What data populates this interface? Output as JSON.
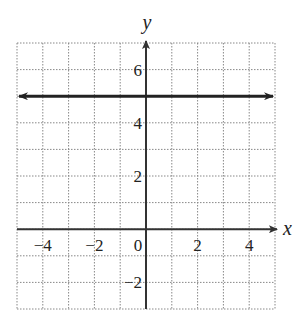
{
  "chart_data": {
    "type": "line",
    "title": "",
    "xlabel": "x",
    "ylabel": "y",
    "xlim": [
      -5,
      5
    ],
    "ylim": [
      -3,
      7
    ],
    "grid": true,
    "grid_style": "dotted",
    "x_ticks": [
      -4,
      -2,
      0,
      2,
      4
    ],
    "x_tick_labels": [
      "−4",
      "−2",
      "0",
      "2",
      "4"
    ],
    "y_ticks": [
      -2,
      2,
      4,
      6
    ],
    "y_tick_labels": [
      "−2",
      "2",
      "4",
      "6"
    ],
    "series": [
      {
        "name": "y = 5",
        "equation": "y = 5",
        "x": [
          -5,
          5
        ],
        "y": [
          5,
          5
        ],
        "arrows_both_ends": true,
        "color": "#222222"
      }
    ]
  },
  "colors": {
    "axis": "#333333",
    "grid": "#888888",
    "line": "#222222"
  }
}
